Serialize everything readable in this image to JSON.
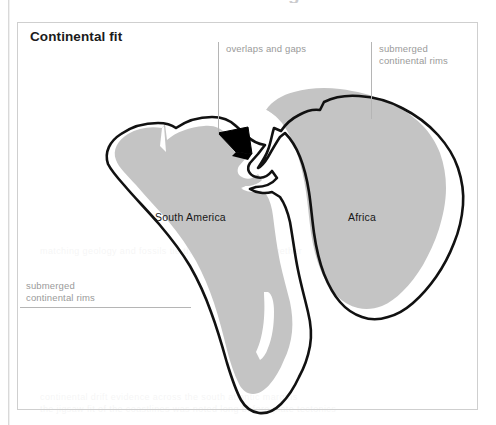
{
  "page": {
    "top_cut_heading": "a tribute to Alfred Wegener",
    "bleed_lines": [
      "continental drift evidence across the south atlantic margins",
      "the jigsaw fit of the coastlines was noted long before plate tectonics",
      "matching geology and fossils tie the two continents together"
    ]
  },
  "figure": {
    "title": "Continental fit",
    "frame_border_color": "#cfcfcf",
    "shelf_fill_color": "#c4c4c4",
    "coastline_color": "#111111",
    "overlap_fill_color": "#000000",
    "label_color": "#9a9a9a"
  },
  "continent_labels": [
    {
      "name": "south-america",
      "text": "South America"
    },
    {
      "name": "africa",
      "text": "Africa"
    }
  ],
  "annotations": [
    {
      "name": "overlaps-and-gaps",
      "text": "overlaps and gaps",
      "leader": "vertical"
    },
    {
      "name": "submerged-continental-rims-right",
      "text": "submerged\ncontinental rims",
      "leader": "vertical"
    },
    {
      "name": "submerged-continental-rims-left",
      "text": "submerged\ncontinental rims",
      "leader": "horizontal"
    }
  ]
}
